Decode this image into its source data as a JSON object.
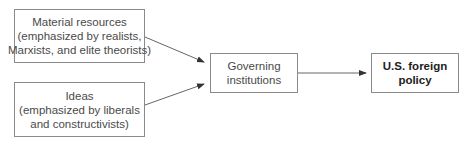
{
  "diagram": {
    "nodes": {
      "material_resources": {
        "line1": "Material resources",
        "line2": "(emphasized by realists,",
        "line3": "Marxists, and elite theorists)"
      },
      "ideas": {
        "line1": "Ideas",
        "line2": "(emphasized by liberals",
        "line3": "and constructivists)"
      },
      "governing_institutions": {
        "line1": "Governing",
        "line2": "institutions"
      },
      "us_foreign_policy": {
        "line1": "U.S. foreign",
        "line2": "policy"
      }
    },
    "edges": [
      {
        "from": "material_resources",
        "to": "governing_institutions"
      },
      {
        "from": "ideas",
        "to": "governing_institutions"
      },
      {
        "from": "governing_institutions",
        "to": "us_foreign_policy"
      }
    ],
    "colors": {
      "border": "#8a8a8a",
      "arrow": "#555555",
      "text": "#4a4a4a",
      "bold_text": "#222222"
    }
  }
}
